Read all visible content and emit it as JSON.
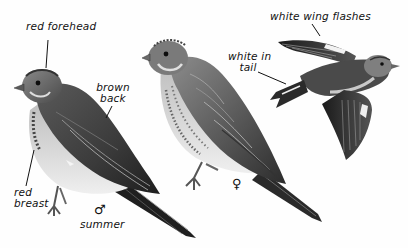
{
  "plate": {
    "subject": "Linnet illustration plate",
    "figures": [
      {
        "id": "male-summer",
        "pose": "perched",
        "sex_symbol": "♂",
        "season_label": "summer",
        "annotations": [
          "red forehead",
          "brown back",
          "red breast"
        ]
      },
      {
        "id": "female",
        "pose": "perched",
        "sex_symbol": "♀"
      },
      {
        "id": "flight",
        "pose": "flying",
        "annotations": [
          "white wing flashes",
          "white in tail"
        ]
      }
    ]
  },
  "labels": {
    "red_forehead": "red forehead",
    "brown_back_line1": "brown",
    "brown_back_line2": "back",
    "red_breast_line1": "red",
    "red_breast_line2": "breast",
    "male_symbol": "♂",
    "summer": "summer",
    "female_symbol": "♀",
    "white_wing_flashes": "white wing flashes",
    "white_in_tail_line1": "white in",
    "white_in_tail_line2": "tail"
  },
  "colors": {
    "ink": "#111111",
    "background": "#fefefe",
    "plumage_dark": "#2a2a2a",
    "plumage_mid": "#6b6b6b",
    "plumage_light": "#bdbdbd",
    "belly": "#e6e6e6"
  }
}
